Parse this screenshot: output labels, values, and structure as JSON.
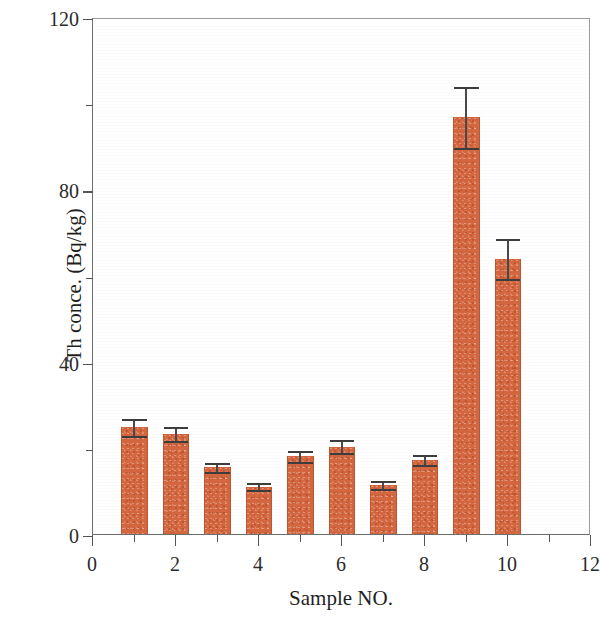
{
  "chart_data": {
    "type": "bar",
    "title": "",
    "xlabel": "Sample NO.",
    "ylabel": "Th conce. (Bq/kg)",
    "xlim": [
      0,
      12
    ],
    "ylim": [
      0,
      120
    ],
    "x_major_ticks": [
      0,
      2,
      4,
      6,
      8,
      10,
      12
    ],
    "x_minor_ticks": [
      1,
      3,
      5,
      7,
      9,
      11
    ],
    "x_tick_labels": [
      "0",
      "2",
      "4",
      "6",
      "8",
      "10",
      "12"
    ],
    "y_major_ticks": [
      0,
      40,
      80,
      120
    ],
    "y_minor_ticks": [
      20,
      60,
      100
    ],
    "y_tick_labels": [
      "0",
      "40",
      "80",
      "120"
    ],
    "grid": false,
    "legend": false,
    "bar_color": "#d4673f",
    "error_bar_color": "#4a4a4a",
    "axis_color": "#5b5b5b",
    "categories": [
      1,
      2,
      3,
      4,
      5,
      6,
      7,
      8,
      9,
      10
    ],
    "values": [
      24.8,
      23.2,
      15.5,
      11.0,
      18.0,
      20.3,
      11.3,
      17.2,
      96.7,
      63.8
    ],
    "errors": [
      2.0,
      1.7,
      1.0,
      0.9,
      1.3,
      1.6,
      0.9,
      1.2,
      7.0,
      4.6
    ],
    "bar_width_units": 0.63,
    "series": [
      {
        "name": "Th concentration",
        "values": [
          24.8,
          23.2,
          15.5,
          11.0,
          18.0,
          20.3,
          11.3,
          17.2,
          96.7,
          63.8
        ],
        "errors": [
          2.0,
          1.7,
          1.0,
          0.9,
          1.3,
          1.6,
          0.9,
          1.2,
          7.0,
          4.6
        ]
      }
    ]
  }
}
